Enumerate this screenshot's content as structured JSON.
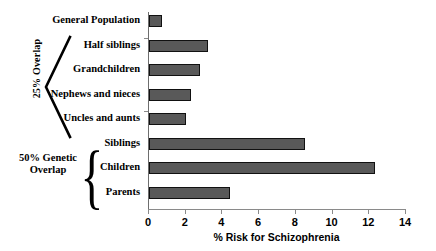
{
  "chart_data": {
    "type": "bar",
    "orientation": "horizontal",
    "title": "",
    "xlabel": "% Risk for Schizophrenia",
    "ylabel": "",
    "xlim": [
      0,
      14
    ],
    "xticks": [
      "0",
      "2",
      "4",
      "6",
      "8",
      "10",
      "12",
      "14"
    ],
    "grid": false,
    "legend": null,
    "bar_color": "#595959",
    "bar_edge_color": "#111111",
    "categories": [
      "General Population",
      "Half siblings",
      "Grandchildren",
      "Nephews and nieces",
      "Uncles and aunts",
      "Siblings",
      "Children",
      "Parents"
    ],
    "values": [
      0.7,
      3.2,
      2.8,
      2.3,
      2.0,
      8.5,
      12.3,
      4.4
    ],
    "annotations": [
      {
        "label": "25% Overlap",
        "bracket": "angular",
        "spans": [
          "Half siblings",
          "Grandchildren",
          "Nephews and nieces",
          "Uncles and aunts"
        ]
      },
      {
        "label": "50% Genetic Overlap",
        "label_line1": "50% Genetic",
        "label_line2": "Overlap",
        "bracket": "curly",
        "spans": [
          "Siblings",
          "Children",
          "Parents"
        ]
      }
    ]
  }
}
